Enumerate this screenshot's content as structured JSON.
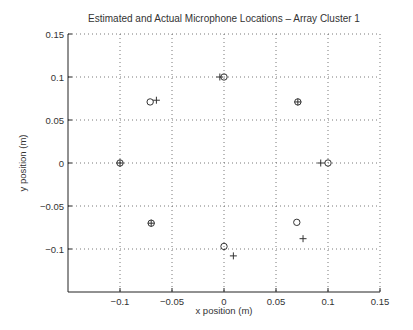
{
  "chart_data": {
    "type": "scatter",
    "title": "Estimated and Actual Microphone Locations – Array Cluster 1",
    "xlabel": "x position (m)",
    "ylabel": "y position (m)",
    "xlim": [
      -0.15,
      0.15
    ],
    "ylim": [
      -0.15,
      0.15
    ],
    "xticks": [
      -0.1,
      -0.05,
      0,
      0.05,
      0.1,
      0.15
    ],
    "xtick_labels": [
      "−0.1",
      "−0.05",
      "0",
      "0.05",
      "0.1",
      "0.15"
    ],
    "yticks": [
      0.15,
      0.1,
      0.05,
      0,
      -0.05,
      -0.1
    ],
    "ytick_labels": [
      "0.15",
      "0.1",
      "0.05",
      "0",
      "−0.05",
      "−0.1"
    ],
    "grid": true,
    "legend": null,
    "series": [
      {
        "name": "Actual (circle)",
        "marker": "o",
        "points": [
          {
            "x": -0.1,
            "y": 0.0
          },
          {
            "x": -0.071,
            "y": 0.071
          },
          {
            "x": 0.0,
            "y": 0.1
          },
          {
            "x": 0.071,
            "y": 0.071
          },
          {
            "x": 0.1,
            "y": 0.0
          },
          {
            "x": 0.07,
            "y": -0.069
          },
          {
            "x": 0.0,
            "y": -0.097
          },
          {
            "x": -0.07,
            "y": -0.07
          }
        ]
      },
      {
        "name": "Estimated (plus)",
        "marker": "+",
        "points": [
          {
            "x": -0.1,
            "y": 0.0
          },
          {
            "x": -0.065,
            "y": 0.073
          },
          {
            "x": -0.004,
            "y": 0.1
          },
          {
            "x": 0.071,
            "y": 0.071
          },
          {
            "x": 0.093,
            "y": 0.0
          },
          {
            "x": 0.076,
            "y": -0.088
          },
          {
            "x": 0.009,
            "y": -0.108
          },
          {
            "x": -0.07,
            "y": -0.07
          }
        ]
      }
    ]
  }
}
